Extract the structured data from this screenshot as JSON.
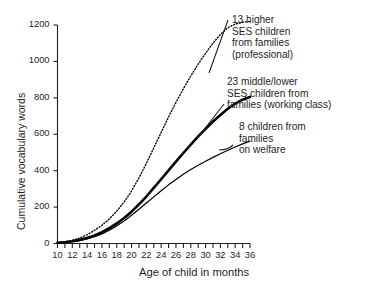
{
  "chart_data": {
    "type": "line",
    "title": "",
    "xlabel": "Age of child in months",
    "ylabel": "Cumulative vocabulary words",
    "xlim": [
      10,
      36
    ],
    "ylim": [
      0,
      1200
    ],
    "xticks": [
      10,
      11,
      12,
      13,
      14,
      15,
      16,
      17,
      18,
      19,
      20,
      21,
      22,
      23,
      24,
      25,
      26,
      27,
      28,
      29,
      30,
      31,
      32,
      33,
      34,
      35,
      36
    ],
    "xtick_labels": [
      "10",
      "12",
      "14",
      "16",
      "18",
      "20",
      "22",
      "24",
      "26",
      "28",
      "30",
      "32",
      "34",
      "36"
    ],
    "xtick_label_values": [
      10,
      12,
      14,
      16,
      18,
      20,
      22,
      24,
      26,
      28,
      30,
      32,
      34,
      36
    ],
    "yticks": [
      0,
      200,
      400,
      600,
      800,
      1000,
      1200
    ],
    "ytick_labels": [
      "0",
      "200",
      "400",
      "600",
      "800",
      "1000",
      "1200"
    ],
    "grid": false,
    "legend_position": "inline-annotations",
    "series": [
      {
        "name": "13 higher SES children from families (professional)",
        "style": "dotted",
        "x": [
          10,
          11,
          12,
          13,
          14,
          15,
          16,
          17,
          18,
          19,
          20,
          21,
          22,
          23,
          24,
          25,
          26,
          27,
          28,
          29,
          30,
          31,
          32,
          33,
          34,
          35,
          36
        ],
        "values": [
          5,
          10,
          18,
          30,
          48,
          72,
          100,
          135,
          178,
          228,
          288,
          360,
          440,
          525,
          610,
          695,
          775,
          850,
          920,
          985,
          1045,
          1100,
          1148,
          1185,
          1205,
          1215,
          1220
        ]
      },
      {
        "name": "23 middle/lower SES children from families (working class)",
        "style": "solid-thick",
        "x": [
          10,
          11,
          12,
          13,
          14,
          15,
          16,
          17,
          18,
          19,
          20,
          21,
          22,
          23,
          24,
          25,
          26,
          27,
          28,
          29,
          30,
          31,
          32,
          33,
          34,
          35,
          36
        ],
        "values": [
          4,
          7,
          12,
          20,
          30,
          44,
          62,
          84,
          110,
          140,
          175,
          215,
          258,
          305,
          353,
          402,
          450,
          497,
          543,
          588,
          630,
          670,
          706,
          740,
          768,
          790,
          805
        ]
      },
      {
        "name": "8 children from families on welfare",
        "style": "solid-thin",
        "x": [
          10,
          11,
          12,
          13,
          14,
          15,
          16,
          17,
          18,
          19,
          20,
          21,
          22,
          23,
          24,
          25,
          26,
          27,
          28,
          29,
          30,
          31,
          32,
          33,
          34,
          35,
          36
        ],
        "values": [
          3,
          6,
          10,
          16,
          25,
          37,
          53,
          73,
          97,
          124,
          155,
          188,
          222,
          256,
          290,
          322,
          352,
          380,
          406,
          430,
          452,
          473,
          493,
          512,
          530,
          547,
          562
        ]
      }
    ],
    "annotations": [
      {
        "id": "annot-professional",
        "lines": [
          "13 higher",
          "SES children",
          "from families",
          "(professional)"
        ]
      },
      {
        "id": "annot-working-class",
        "lines": [
          "23 middle/lower",
          "SES children from",
          "families (working class)"
        ]
      },
      {
        "id": "annot-welfare",
        "lines": [
          "8 children from",
          "families",
          "on welfare"
        ]
      }
    ]
  },
  "colors": {
    "ink": "#231f20",
    "line": "#000000",
    "background": "#ffffff"
  }
}
